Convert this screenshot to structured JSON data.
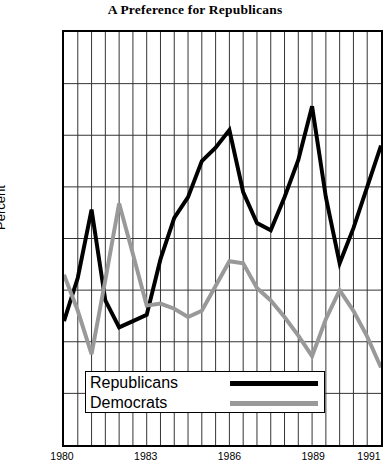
{
  "chart_data": {
    "type": "line",
    "title": "A Preference for Republicans",
    "xlabel": "",
    "ylabel": "Percent",
    "ylim": [
      20,
      60
    ],
    "ytick_step": 5,
    "yticks": [
      20,
      25,
      30,
      35,
      40,
      45,
      50,
      55,
      60
    ],
    "xlim": [
      1980,
      1991.5
    ],
    "x": [
      1980,
      1980.5,
      1981,
      1981.5,
      1982,
      1982.5,
      1983,
      1983.5,
      1984,
      1984.5,
      1985,
      1985.5,
      1986,
      1986.5,
      1987,
      1987.5,
      1988,
      1988.5,
      1989,
      1989.5,
      1990,
      1990.5,
      1991,
      1991.5
    ],
    "xticks": [
      1980,
      1983,
      1986,
      1989,
      1991
    ],
    "xtick_labels": [
      "1980",
      "1983",
      "1986",
      "1989",
      "1991"
    ],
    "grid": true,
    "legend_position": "bottom-left-inside",
    "series": [
      {
        "name": "Republicans",
        "color": "#000000",
        "values": [
          32.0,
          36.2,
          42.8,
          34.0,
          31.4,
          32.0,
          32.6,
          38.0,
          42.0,
          44.0,
          47.5,
          48.8,
          50.5,
          44.5,
          41.5,
          40.8,
          44.0,
          47.6,
          52.8,
          44.0,
          37.6,
          41.0,
          45.0,
          49.0
        ]
      },
      {
        "name": "Democrats",
        "color": "#999999",
        "values": [
          36.5,
          33.0,
          28.8,
          36.0,
          43.4,
          38.5,
          33.5,
          33.7,
          33.2,
          32.4,
          33.0,
          35.4,
          37.8,
          37.6,
          35.2,
          34.0,
          32.4,
          30.6,
          28.6,
          32.2,
          35.0,
          33.0,
          30.5,
          27.5
        ]
      }
    ]
  },
  "chart": {
    "title": "A Preference for Republicans",
    "y_axis_label": "Percent",
    "y_tick_labels": [
      "60",
      "55",
      "50",
      "45",
      "40",
      "35",
      "30",
      "25",
      "20"
    ],
    "x_tick_labels": [
      "1980",
      "1983",
      "1986",
      "1989",
      "1991"
    ]
  },
  "legend": {
    "items": [
      {
        "label": "Republicans",
        "color": "#000000"
      },
      {
        "label": "Democrats",
        "color": "#999999"
      }
    ]
  }
}
